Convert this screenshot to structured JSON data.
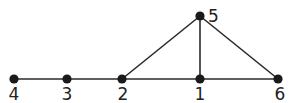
{
  "graph": {
    "nodes": [
      {
        "id": "4",
        "label": "4",
        "x": 14,
        "y": 79,
        "lx": 14,
        "ly": 100,
        "anchor": "middle"
      },
      {
        "id": "3",
        "label": "3",
        "x": 67,
        "y": 79,
        "lx": 67,
        "ly": 100,
        "anchor": "middle"
      },
      {
        "id": "2",
        "label": "2",
        "x": 122,
        "y": 79,
        "lx": 123,
        "ly": 100,
        "anchor": "middle"
      },
      {
        "id": "1",
        "label": "1",
        "x": 200,
        "y": 79,
        "lx": 200,
        "ly": 100,
        "anchor": "middle"
      },
      {
        "id": "6",
        "label": "6",
        "x": 278,
        "y": 79,
        "lx": 280,
        "ly": 100,
        "anchor": "middle"
      },
      {
        "id": "5",
        "label": "5",
        "x": 200,
        "y": 16,
        "lx": 208,
        "ly": 22,
        "anchor": "start"
      }
    ],
    "edges": [
      [
        "4",
        "3"
      ],
      [
        "3",
        "2"
      ],
      [
        "2",
        "1"
      ],
      [
        "1",
        "6"
      ],
      [
        "2",
        "5"
      ],
      [
        "1",
        "5"
      ],
      [
        "5",
        "6"
      ]
    ],
    "colors": {
      "node": "#1a1a1a",
      "edge": "#2a2a2a",
      "label": "#222222"
    }
  }
}
